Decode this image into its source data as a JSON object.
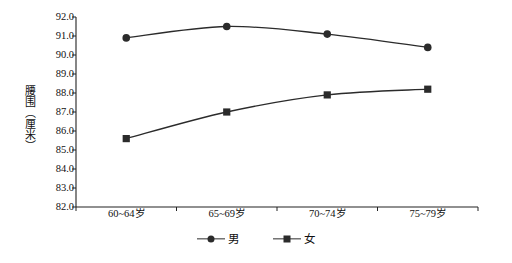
{
  "chart_data": {
    "type": "line",
    "title": "",
    "xlabel": "",
    "ylabel": "腰围（厘米）",
    "categories": [
      "60~64岁",
      "65~69岁",
      "70~74岁",
      "75~79岁"
    ],
    "ylim": [
      82.0,
      92.0
    ],
    "ytick_step": 1.0,
    "yticks": [
      "92.0",
      "91.0",
      "90.0",
      "89.0",
      "88.0",
      "87.0",
      "86.0",
      "85.0",
      "84.0",
      "83.0",
      "82.0"
    ],
    "ytick_values": [
      92.0,
      91.0,
      90.0,
      89.0,
      88.0,
      87.0,
      86.0,
      85.0,
      84.0,
      83.0,
      82.0
    ],
    "grid": false,
    "legend_position": "bottom",
    "series": [
      {
        "name": "男",
        "marker": "circle",
        "color": "#2b2b2b",
        "values": [
          90.9,
          91.5,
          91.1,
          90.4
        ]
      },
      {
        "name": "女",
        "marker": "square",
        "color": "#2b2b2b",
        "values": [
          85.6,
          87.0,
          87.9,
          88.2
        ]
      }
    ]
  },
  "axis": {
    "y_title": "腰围（厘米）"
  },
  "legend": {
    "items": [
      {
        "label": "男",
        "marker": "circle"
      },
      {
        "label": "女",
        "marker": "square"
      }
    ]
  },
  "colors": {
    "line": "#2b2b2b",
    "axis": "#222222",
    "text": "#111111",
    "background": "#ffffff"
  }
}
